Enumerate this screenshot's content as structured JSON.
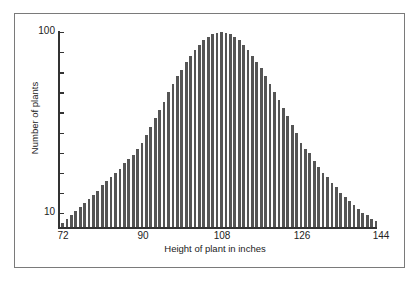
{
  "chart_data": {
    "type": "bar",
    "title": "",
    "xlabel": "Height of plant in inches",
    "ylabel": "Number of plants",
    "x_tick_labels": [
      "72",
      "90",
      "108",
      "126",
      "144"
    ],
    "y_tick_labels": [
      "100",
      "10"
    ],
    "y_ticks": [
      100,
      90,
      80,
      70,
      60,
      50,
      40,
      30,
      20,
      10
    ],
    "xlim": [
      72,
      144
    ],
    "ylim": [
      0,
      100
    ],
    "grid": false,
    "legend": null,
    "x": [
      72,
      73,
      74,
      75,
      76,
      77,
      78,
      79,
      80,
      81,
      82,
      83,
      84,
      85,
      86,
      87,
      88,
      89,
      90,
      91,
      92,
      93,
      94,
      95,
      96,
      97,
      98,
      99,
      100,
      101,
      102,
      103,
      104,
      105,
      106,
      107,
      108,
      109,
      110,
      111,
      112,
      113,
      114,
      115,
      116,
      117,
      118,
      119,
      120,
      121,
      122,
      123,
      124,
      125,
      126,
      127,
      128,
      129,
      130,
      131,
      132,
      133,
      134,
      135,
      136,
      137,
      138,
      139,
      140,
      141,
      142,
      143
    ],
    "values": [
      5,
      7,
      9,
      11,
      13,
      15,
      17,
      19,
      21,
      24,
      26,
      28,
      30,
      32,
      35,
      37,
      39,
      42,
      45,
      49,
      53,
      57,
      61,
      65,
      70,
      74,
      78,
      81,
      85,
      88,
      91,
      93.5,
      96,
      97.5,
      99,
      99.5,
      100,
      99.5,
      99,
      97.5,
      96,
      93.5,
      91,
      88,
      85,
      82,
      78,
      74,
      70,
      66,
      62,
      58,
      54,
      50,
      45,
      42,
      40,
      36,
      33,
      30,
      28,
      25,
      23,
      20,
      18,
      16,
      14,
      12,
      10,
      9,
      7,
      6
    ]
  },
  "labels": {
    "y_top": "100",
    "y_bottom": "10",
    "x_ticks": [
      "72",
      "90",
      "108",
      "126",
      "144"
    ],
    "xlabel": "Height of plant in inches",
    "ylabel": "Number of plants"
  },
  "colors": {
    "bar": "#555555",
    "axis": "#333333",
    "frame": "#7a7a7a"
  }
}
